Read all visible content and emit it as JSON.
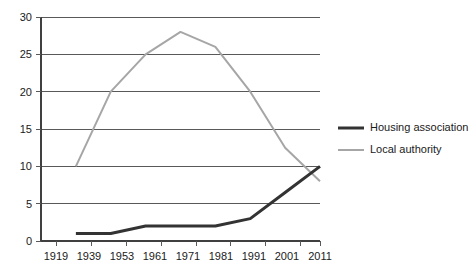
{
  "chart_data": {
    "type": "line",
    "title": "",
    "subtitle": "",
    "xlabel": "",
    "ylabel": "",
    "categories": [
      "1919",
      "1939",
      "1953",
      "1961",
      "1971",
      "1981",
      "1991",
      "2001",
      "2011"
    ],
    "x": [
      1919,
      1939,
      1953,
      1961,
      1971,
      1981,
      1991,
      2001,
      2011
    ],
    "ylim": [
      0,
      30
    ],
    "yticks": [
      0,
      5,
      10,
      15,
      20,
      25,
      30
    ],
    "ytick_labels": [
      "0",
      "5",
      "10",
      "15",
      "20",
      "25",
      "30"
    ],
    "grid": true,
    "grid_axis": "y",
    "legend_position": "right",
    "series": [
      {
        "name": "Housing association",
        "color": "#333333",
        "line_width": 3,
        "values": [
          null,
          1,
          1,
          2,
          2,
          2,
          3,
          6.5,
          10
        ]
      },
      {
        "name": "Local authority",
        "color": "#a6a6a6",
        "line_width": 2,
        "values": [
          null,
          10,
          20,
          25,
          28,
          26,
          20,
          12.5,
          8
        ]
      }
    ]
  },
  "legend": {
    "items": [
      {
        "label": "Housing association",
        "color": "#333333",
        "line_width": 3
      },
      {
        "label": "Local authority",
        "color": "#a6a6a6",
        "line_width": 2
      }
    ]
  },
  "axes": {
    "y_tick_labels": [
      "30",
      "25",
      "20",
      "15",
      "10",
      "5",
      "0"
    ],
    "x_tick_labels": [
      "1919",
      "1939",
      "1953",
      "1961",
      "1971",
      "1981",
      "1991",
      "2001",
      "2011"
    ]
  }
}
